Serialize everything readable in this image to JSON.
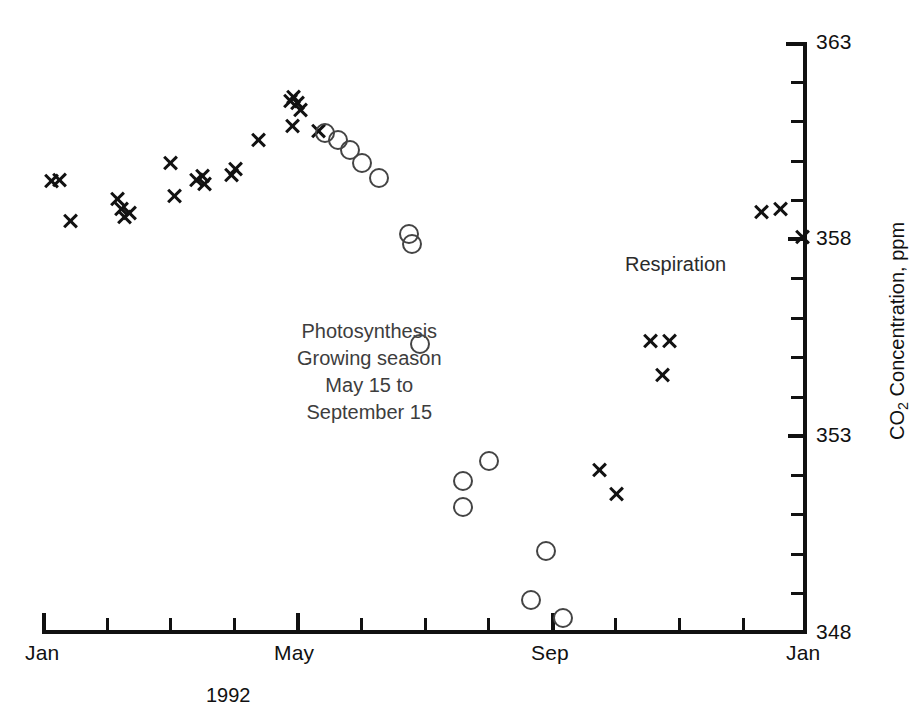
{
  "chart_data": {
    "type": "scatter",
    "title": "",
    "xlabel": "1992",
    "ylabel": "CO2 Concentration, ppm",
    "ylabel_parts": {
      "pre": "CO",
      "sub": "2",
      "post": " Concentration, ppm"
    },
    "ylim": [
      348,
      363
    ],
    "ytick_labels": [
      "363",
      "358",
      "353",
      "348"
    ],
    "ytick_values": [
      363,
      358,
      353,
      348
    ],
    "yticks_minor_step": 1,
    "xlim": [
      "Jan 1992",
      "Jan 1993"
    ],
    "xtick_labels": [
      "Jan",
      "May",
      "Sep",
      "Jan"
    ],
    "xtick_label_months": [
      0,
      4,
      8,
      12
    ],
    "xticks_minor_step_months": 1,
    "grid": false,
    "legend": "none",
    "annotations": [
      {
        "name": "photosynthesis-annotation",
        "lines": [
          "Photosynthesis",
          "Growing season",
          "May 15 to",
          "September 15"
        ],
        "x_px": 297,
        "y_px": 318
      },
      {
        "name": "respiration-annotation",
        "lines": [
          "Respiration"
        ],
        "x_px": 682,
        "y_px": 266
      }
    ],
    "series": [
      {
        "name": "Respiration (non-growing season)",
        "marker": "x",
        "color": "#111111",
        "points": [
          {
            "x_px": 52,
            "y_px": 181,
            "month": 0.3,
            "value": 359.4
          },
          {
            "x_px": 60,
            "y_px": 180,
            "month": 0.45,
            "value": 359.4
          },
          {
            "x_px": 71,
            "y_px": 221,
            "month": 0.65,
            "value": 358.5
          },
          {
            "x_px": 118,
            "y_px": 199,
            "month": 1.45,
            "value": 359.0
          },
          {
            "x_px": 122,
            "y_px": 209,
            "month": 1.52,
            "value": 358.7
          },
          {
            "x_px": 125,
            "y_px": 217,
            "month": 1.58,
            "value": 358.6
          },
          {
            "x_px": 130,
            "y_px": 213,
            "month": 1.66,
            "value": 358.7
          },
          {
            "x_px": 171,
            "y_px": 163,
            "month": 2.38,
            "value": 359.8
          },
          {
            "x_px": 175,
            "y_px": 196,
            "month": 2.45,
            "value": 359.0
          },
          {
            "x_px": 197,
            "y_px": 180,
            "month": 2.82,
            "value": 359.4
          },
          {
            "x_px": 203,
            "y_px": 176,
            "month": 2.92,
            "value": 359.5
          },
          {
            "x_px": 205,
            "y_px": 184,
            "month": 2.96,
            "value": 359.3
          },
          {
            "x_px": 232,
            "y_px": 175,
            "month": 3.42,
            "value": 359.5
          },
          {
            "x_px": 236,
            "y_px": 169,
            "month": 3.49,
            "value": 359.6
          },
          {
            "x_px": 259,
            "y_px": 140,
            "month": 3.88,
            "value": 360.4
          },
          {
            "x_px": 291,
            "y_px": 101,
            "month": 4.43,
            "value": 361.4
          },
          {
            "x_px": 294,
            "y_px": 97,
            "month": 4.48,
            "value": 361.5
          },
          {
            "x_px": 298,
            "y_px": 103,
            "month": 4.55,
            "value": 361.3
          },
          {
            "x_px": 301,
            "y_px": 110,
            "month": 4.6,
            "value": 361.1
          },
          {
            "x_px": 293,
            "y_px": 126,
            "month": 4.47,
            "value": 360.7
          },
          {
            "x_px": 319,
            "y_px": 131,
            "month": 4.91,
            "value": 360.6
          },
          {
            "x_px": 651,
            "y_px": 341,
            "month": 10.55,
            "value": 355.3
          },
          {
            "x_px": 670,
            "y_px": 341,
            "month": 10.88,
            "value": 355.3
          },
          {
            "x_px": 663,
            "y_px": 375,
            "month": 10.76,
            "value": 354.4
          },
          {
            "x_px": 600,
            "y_px": 470,
            "month": 9.69,
            "value": 352.0
          },
          {
            "x_px": 617,
            "y_px": 494,
            "month": 9.98,
            "value": 351.4
          },
          {
            "x_px": 762,
            "y_px": 212,
            "month": 12.0,
            "value": 358.7
          },
          {
            "x_px": 781,
            "y_px": 209,
            "month": 12.0,
            "value": 358.8
          },
          {
            "x_px": 803,
            "y_px": 237,
            "month": 12.0,
            "value": 358.0
          }
        ]
      },
      {
        "name": "Photosynthesis (growing season May 15 to September 15)",
        "marker": "o",
        "color": "#444444",
        "points": [
          {
            "x_px": 325,
            "y_px": 133,
            "month": 5.0,
            "value": 360.5
          },
          {
            "x_px": 338,
            "y_px": 140,
            "month": 5.22,
            "value": 360.4
          },
          {
            "x_px": 350,
            "y_px": 150,
            "month": 5.42,
            "value": 360.1
          },
          {
            "x_px": 362,
            "y_px": 163,
            "month": 5.62,
            "value": 359.8
          },
          {
            "x_px": 379,
            "y_px": 178,
            "month": 5.91,
            "value": 359.4
          },
          {
            "x_px": 409,
            "y_px": 234,
            "month": 6.42,
            "value": 358.1
          },
          {
            "x_px": 412,
            "y_px": 244,
            "month": 6.47,
            "value": 357.8
          },
          {
            "x_px": 420,
            "y_px": 344,
            "month": 6.6,
            "value": 355.3
          },
          {
            "x_px": 463,
            "y_px": 481,
            "month": 7.33,
            "value": 351.8
          },
          {
            "x_px": 463,
            "y_px": 507,
            "month": 7.33,
            "value": 351.1
          },
          {
            "x_px": 489,
            "y_px": 461,
            "month": 7.77,
            "value": 352.3
          },
          {
            "x_px": 546,
            "y_px": 551,
            "month": 8.74,
            "value": 350.0
          },
          {
            "x_px": 531,
            "y_px": 600,
            "month": 8.49,
            "value": 348.8
          },
          {
            "x_px": 563,
            "y_px": 618,
            "month": 9.03,
            "value": 348.3
          }
        ]
      }
    ]
  },
  "axes_geometry": {
    "left_px": 42,
    "right_px": 806,
    "top_px": 42,
    "bottom_px": 632
  }
}
